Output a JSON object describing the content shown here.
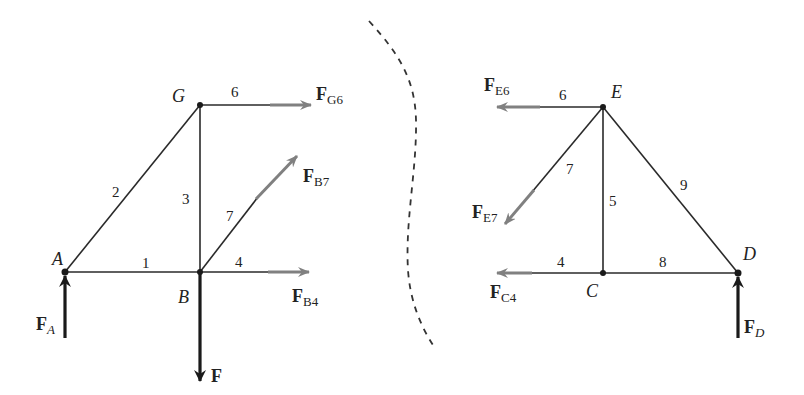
{
  "diagram": {
    "type": "truss free-body diagram (method of sections)",
    "colors": {
      "member": "#2a2a2a",
      "member_force_arrow": "#808080",
      "external_force_arrow": "#1a1a1a",
      "section_cut": "#333333"
    },
    "left_section": {
      "nodes": [
        {
          "id": "A",
          "label": "A",
          "x": 65,
          "y": 272
        },
        {
          "id": "G",
          "label": "G",
          "x": 200,
          "y": 105
        },
        {
          "id": "B",
          "label": "B",
          "x": 200,
          "y": 272
        }
      ],
      "members": [
        {
          "label": "1",
          "from": "A",
          "to": "B"
        },
        {
          "label": "2",
          "from": "A",
          "to": "G"
        },
        {
          "label": "3",
          "from": "G",
          "to": "B"
        },
        {
          "label": "6",
          "from": "G",
          "to": "cut"
        },
        {
          "label": "7",
          "from": "B",
          "to": "cut"
        },
        {
          "label": "4",
          "from": "B",
          "to": "cut"
        }
      ],
      "forces": {
        "FG6": {
          "main": "F",
          "sub": "G6"
        },
        "FB7": {
          "main": "F",
          "sub": "B7"
        },
        "FB4": {
          "main": "F",
          "sub": "B4"
        },
        "F": {
          "main": "F",
          "sub": ""
        },
        "FA": {
          "main": "F",
          "sub": "A"
        }
      },
      "member_labels": {
        "m1": "1",
        "m2": "2",
        "m3": "3",
        "m4": "4",
        "m6": "6",
        "m7": "7"
      }
    },
    "right_section": {
      "nodes": [
        {
          "id": "E",
          "label": "E",
          "x": 603,
          "y": 107
        },
        {
          "id": "C",
          "label": "C",
          "x": 603,
          "y": 273
        },
        {
          "id": "D",
          "label": "D",
          "x": 738,
          "y": 273
        }
      ],
      "members": [
        {
          "label": "5",
          "from": "E",
          "to": "C"
        },
        {
          "label": "8",
          "from": "C",
          "to": "D"
        },
        {
          "label": "9",
          "from": "E",
          "to": "D"
        },
        {
          "label": "6",
          "from": "E",
          "to": "cut"
        },
        {
          "label": "7",
          "from": "E",
          "to": "cut"
        },
        {
          "label": "4",
          "from": "C",
          "to": "cut"
        }
      ],
      "forces": {
        "FE6": {
          "main": "F",
          "sub": "E6"
        },
        "FE7": {
          "main": "F",
          "sub": "E7"
        },
        "FC4": {
          "main": "F",
          "sub": "C4"
        },
        "FD": {
          "main": "F",
          "sub": "D"
        }
      },
      "member_labels": {
        "m4": "4",
        "m5": "5",
        "m6": "6",
        "m7": "7",
        "m8": "8",
        "m9": "9"
      }
    },
    "labels": {
      "A": "A",
      "B": "B",
      "G": "G",
      "C": "C",
      "D": "D",
      "E": "E"
    }
  }
}
